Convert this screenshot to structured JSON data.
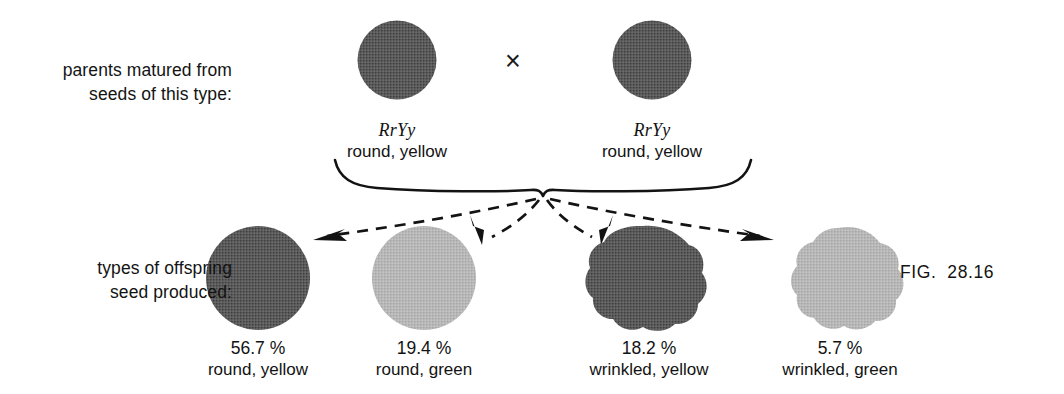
{
  "figure": {
    "caption": "FIG.  28.16",
    "cross_symbol": "×"
  },
  "rows": {
    "parents": {
      "side_label_line1": "parents matured from",
      "side_label_line2": "seeds of this type:"
    },
    "offspring": {
      "side_label_line1": "types of offspring",
      "side_label_line2": "seed produced:"
    }
  },
  "parents": [
    {
      "id": "parent-left",
      "genotype": "RrYy",
      "phenotype": "round, yellow",
      "shape": "round",
      "color": "#595959"
    },
    {
      "id": "parent-right",
      "genotype": "RrYy",
      "phenotype": "round, yellow",
      "shape": "round",
      "color": "#595959"
    }
  ],
  "offspring": [
    {
      "id": "offspring-round-yellow",
      "percent": "56.7 %",
      "phenotype": "round, yellow",
      "shape": "round",
      "color": "#585858"
    },
    {
      "id": "offspring-round-green",
      "percent": "19.4 %",
      "phenotype": "round, green",
      "shape": "round",
      "color": "#b6b6b6"
    },
    {
      "id": "offspring-wrinkled-yellow",
      "percent": "18.2 %",
      "phenotype": "wrinkled, yellow",
      "shape": "wrinkled",
      "color": "#555555"
    },
    {
      "id": "offspring-wrinkled-green",
      "percent": "5.7 %",
      "phenotype": "wrinkled, green",
      "shape": "wrinkled",
      "color": "#b8b8b8"
    }
  ],
  "colors": {
    "dark_seed": "#585858",
    "light_seed": "#b6b6b6",
    "ink": "#131313",
    "background": "#ffffff"
  }
}
